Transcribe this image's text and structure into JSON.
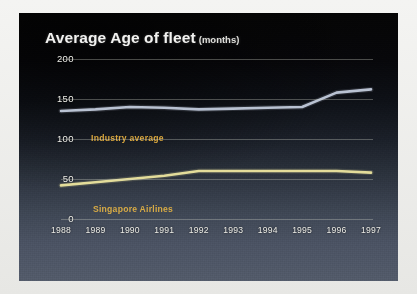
{
  "chart": {
    "title": "Average Age of fleet",
    "unit": "(months)"
  },
  "colors": {
    "industry_line": "#b9c2d2",
    "sia_line": "#e3dc9a",
    "label_gold": "#d8a63e",
    "grid": "#d0d2c8",
    "panel_top": "#050505",
    "panel_bottom": "#525a69",
    "axis_text": "#efefe9"
  },
  "chart_data": {
    "type": "line",
    "xlabel": "",
    "ylabel": "",
    "ylim": [
      0,
      200
    ],
    "yticks": [
      "0",
      "50",
      "100",
      "150",
      "200"
    ],
    "grid": true,
    "legend_position": "inline",
    "categories": [
      "1988",
      "1989",
      "1990",
      "1991",
      "1992",
      "1993",
      "1994",
      "1995",
      "1996",
      "1997"
    ],
    "series": [
      {
        "name": "Industry average",
        "color": "#b9c2d2",
        "values": [
          135,
          137,
          140,
          139,
          137,
          138,
          139,
          140,
          158,
          162
        ]
      },
      {
        "name": "Singapore Airlines",
        "color": "#e3dc9a",
        "values": [
          42,
          46,
          50,
          54,
          60,
          60,
          60,
          60,
          60,
          58
        ]
      }
    ]
  }
}
